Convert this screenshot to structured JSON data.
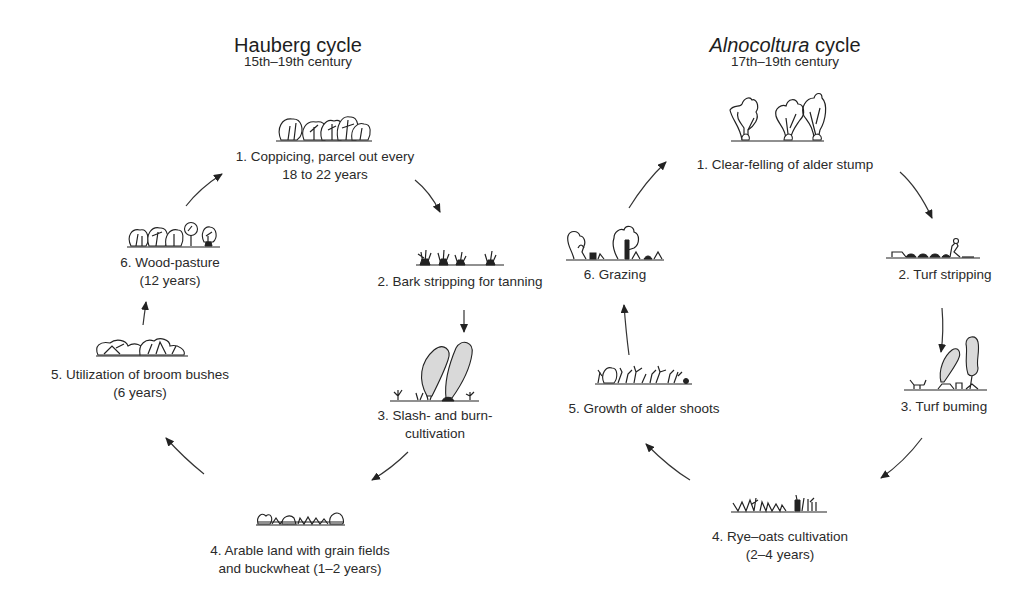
{
  "hauberg": {
    "title": "Hauberg cycle",
    "period": "15th–19th century",
    "stages": [
      {
        "line1": "1. Coppicing, parcel out every",
        "line2": "18 to 22 years",
        "icon": "coppice-trees-icon"
      },
      {
        "line1": "2. Bark stripping for tanning",
        "line2": "",
        "icon": "stripped-stumps-icon"
      },
      {
        "line1": "3. Slash- and burn-",
        "line2": "cultivation",
        "icon": "burning-smoke-icon"
      },
      {
        "line1": "4. Arable land with grain fields",
        "line2": "and buckwheat (1–2 years)",
        "icon": "grain-field-icon"
      },
      {
        "line1": "5. Utilization of broom bushes",
        "line2": "(6 years)",
        "icon": "broom-bushes-icon"
      },
      {
        "line1": "6. Wood-pasture",
        "line2": "(12 years)",
        "icon": "wood-pasture-trees-icon"
      }
    ]
  },
  "alnocoltura": {
    "title_italic": "Alnocoltura",
    "title_rest": " cycle",
    "period": "17th–19th century",
    "stages": [
      {
        "line1": "1. Clear-felling of alder stump",
        "line2": "",
        "icon": "alder-trees-icon"
      },
      {
        "line1": "2. Turf stripping",
        "line2": "",
        "icon": "turf-stripping-icon"
      },
      {
        "line1": "3. Turf buming",
        "line2": "",
        "icon": "turf-burning-smoke-icon"
      },
      {
        "line1": "4. Rye–oats cultivation",
        "line2": "(2–4 years)",
        "icon": "rye-oats-field-icon"
      },
      {
        "line1": "5. Growth of alder shoots",
        "line2": "",
        "icon": "alder-shoots-icon"
      },
      {
        "line1": "6. Grazing",
        "line2": "",
        "icon": "grazing-icon"
      }
    ]
  },
  "colors": {
    "ink": "#222222",
    "smoke_fill": "#d9d9d9",
    "background": "#ffffff"
  }
}
